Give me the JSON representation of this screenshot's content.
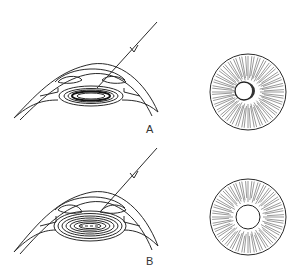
{
  "figure": {
    "panels": [
      {
        "id": "A",
        "label": "A",
        "description": "Eye cross-section with oblique light ray; lens with dark thin concentric lamellae; iris with eccentric pupil showing shaded crescent"
      },
      {
        "id": "B",
        "label": "B",
        "description": "Eye cross-section with oblique light ray; thicker lens with many concentric rings; iris with centered round pupil"
      }
    ],
    "colors": {
      "line": "#2a2a2a",
      "background": "#ffffff"
    }
  }
}
